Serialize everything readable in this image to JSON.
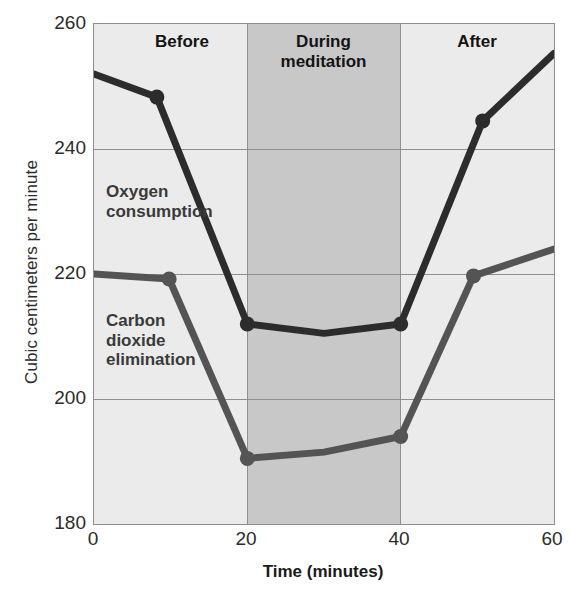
{
  "chart_data": {
    "type": "line",
    "title": "",
    "xlabel": "Time (minutes)",
    "ylabel": "Cubic centimeters per minute",
    "xlim": [
      0,
      60
    ],
    "ylim": [
      180,
      260
    ],
    "xticks": [
      0,
      20,
      40,
      60
    ],
    "yticks": [
      180,
      200,
      220,
      240,
      260
    ],
    "grid": true,
    "legend_position": "inline-annotation",
    "shaded_region": {
      "label": "During meditation",
      "x_start": 20,
      "x_end": 40,
      "color": "#c8c8c8"
    },
    "annotations": [
      {
        "text": "Before",
        "x": 10,
        "y": 258
      },
      {
        "text": "During meditation",
        "x": 30,
        "y": 258
      },
      {
        "text": "After",
        "x": 50,
        "y": 258
      },
      {
        "text": "Oxygen consumption",
        "x": 3,
        "y": 231
      },
      {
        "text": "Carbon dioxide elimination",
        "x": 3,
        "y": 215
      }
    ],
    "series": [
      {
        "name": "Oxygen consumption",
        "color": "#2c2c2c",
        "x": [
          0,
          8.2,
          20,
          30,
          40,
          50.7,
          60
        ],
        "values": [
          252,
          248.3,
          212,
          210.5,
          212,
          244.5,
          255.3
        ],
        "markers_at": [
          8.2,
          20,
          40,
          50.7
        ]
      },
      {
        "name": "Carbon dioxide elimination",
        "color": "#545454",
        "x": [
          0,
          9.8,
          20,
          30,
          40,
          49.5,
          60
        ],
        "values": [
          220,
          219.2,
          190.5,
          191.5,
          194,
          219.7,
          224
        ],
        "markers_at": [
          9.8,
          20,
          40,
          49.5
        ]
      }
    ]
  },
  "axes": {
    "y_title": "Cubic centimeters per minute",
    "x_title": "Time (minutes)",
    "y_tick_labels": [
      "260",
      "240",
      "220",
      "200",
      "180"
    ],
    "x_tick_labels": [
      "0",
      "20",
      "40",
      "60"
    ]
  },
  "bands": {
    "before": "Before",
    "during_line1": "During",
    "during_line2": "meditation",
    "after": "After"
  },
  "series_labels": {
    "oxygen_line1": "Oxygen",
    "oxygen_line2": "consumption",
    "co2_line1": "Carbon",
    "co2_line2": "dioxide",
    "co2_line3": "elimination"
  },
  "colors": {
    "plot_background": "#ebebeb",
    "shade": "#c8c8c8",
    "grid": "#8f8f8f",
    "oxygen": "#2c2c2c",
    "co2": "#545454"
  }
}
